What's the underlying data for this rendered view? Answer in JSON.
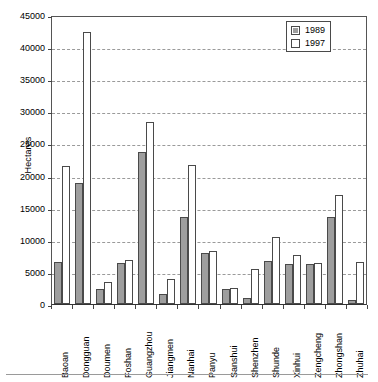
{
  "chart_data": {
    "type": "bar",
    "title": "",
    "xlabel": "",
    "ylabel": "Hectares",
    "ylim": [
      0,
      45000
    ],
    "ytick_step": 5000,
    "yticks": [
      "0",
      "5000",
      "10000",
      "15000",
      "20000",
      "25000",
      "30000",
      "35000",
      "40000",
      "45000"
    ],
    "grid": true,
    "legend_position": "top-right",
    "categories": [
      "Baoan",
      "Dongguan",
      "Doumen",
      "Foshan",
      "Guangzhou",
      "Jiangmen",
      "Nanhai",
      "Panyu",
      "Sanshui",
      "Shenzhen",
      "Shunde",
      "Xinhui",
      "Zengcheng",
      "Zhongshan",
      "Zhuhai"
    ],
    "series": [
      {
        "name": "1989",
        "color": "#9e9e9e",
        "values": [
          6500,
          18900,
          2300,
          6400,
          23600,
          1500,
          13500,
          7900,
          2400,
          1000,
          6700,
          6200,
          6200,
          13500,
          700
        ]
      },
      {
        "name": "1997",
        "color": "#ffffff",
        "values": [
          21500,
          42300,
          3400,
          6900,
          28400,
          3900,
          21600,
          8300,
          2500,
          5400,
          10400,
          7600,
          6400,
          17000,
          6500
        ]
      }
    ]
  },
  "legend": {
    "entries": [
      {
        "label": "1989",
        "swatch": "filled-gray-square-icon"
      },
      {
        "label": "1997",
        "swatch": "empty-white-square-icon"
      }
    ]
  }
}
